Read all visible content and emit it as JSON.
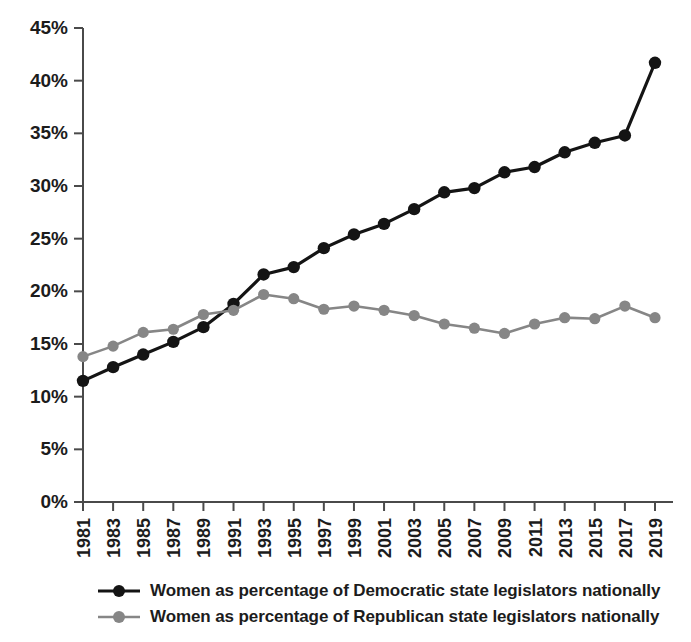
{
  "chart_data": {
    "type": "line",
    "title": "",
    "subtitle": "",
    "xlabel": "",
    "ylabel": "",
    "xlim": [
      1981,
      2019
    ],
    "ylim": [
      0,
      45
    ],
    "ytick_values": [
      0,
      5,
      10,
      15,
      20,
      25,
      30,
      35,
      40,
      45
    ],
    "ytick_labels": [
      "0%",
      "5%",
      "10%",
      "15%",
      "20%",
      "25%",
      "30%",
      "35%",
      "40%",
      "45%"
    ],
    "x": [
      1981,
      1983,
      1985,
      1987,
      1989,
      1991,
      1993,
      1995,
      1997,
      1999,
      2001,
      2003,
      2005,
      2007,
      2009,
      2011,
      2013,
      2015,
      2017,
      2019
    ],
    "xtick_labels": [
      "1981",
      "1983",
      "1985",
      "1987",
      "1989",
      "1991",
      "1993",
      "1995",
      "1997",
      "1999",
      "2001",
      "2003",
      "2005",
      "2007",
      "2009",
      "2011",
      "2013",
      "2015",
      "2017",
      "2019"
    ],
    "grid": false,
    "legend_position": "bottom",
    "series": [
      {
        "name": "Women as percentage of Democratic state legislators nationally",
        "color": "#141414",
        "marker": "circle",
        "values": [
          11.5,
          12.8,
          14.0,
          15.2,
          16.6,
          18.8,
          21.6,
          22.3,
          24.1,
          25.4,
          26.4,
          27.8,
          29.4,
          29.8,
          31.3,
          31.8,
          33.2,
          34.1,
          34.8,
          41.7
        ]
      },
      {
        "name": "Women as percentage of Republican state legislators nationally",
        "color": "#868686",
        "marker": "circle",
        "values": [
          13.8,
          14.8,
          16.1,
          16.4,
          17.8,
          18.2,
          19.7,
          19.3,
          18.3,
          18.6,
          18.2,
          17.7,
          16.9,
          16.5,
          16.0,
          16.9,
          17.5,
          17.4,
          18.6,
          17.5
        ]
      }
    ]
  },
  "legend": {
    "items": [
      {
        "label": "Women as percentage of Democratic state legislators nationally",
        "color": "#141414"
      },
      {
        "label": "Women as percentage of Republican state legislators nationally",
        "color": "#868686"
      }
    ]
  }
}
